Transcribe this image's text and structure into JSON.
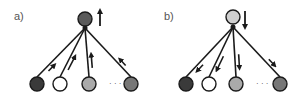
{
  "panels": [
    {
      "label": "a)",
      "direction": "up",
      "top_node": {
        "cx": 85,
        "cy": 19,
        "fill": "#5a5a5a"
      },
      "top_arrow": {
        "x": 100,
        "y1": 26,
        "y2": 11
      },
      "hub": {
        "x": 85,
        "y": 28
      },
      "bottom_nodes": [
        {
          "cx": 37,
          "cy": 84,
          "fill": "#3a3a3a"
        },
        {
          "cx": 60,
          "cy": 84,
          "fill": "#ffffff"
        },
        {
          "cx": 89,
          "cy": 84,
          "fill": "#aaaaaa"
        },
        {
          "cx": 131,
          "cy": 84,
          "fill": "#777777"
        }
      ],
      "ellipsis": {
        "x": 109,
        "y": 86,
        "text": "· · ·"
      }
    },
    {
      "label": "b)",
      "direction": "down",
      "top_node": {
        "cx": 233,
        "cy": 17,
        "fill": "#cfcfcf"
      },
      "top_arrow": {
        "x": 245,
        "y1": 11,
        "y2": 27
      },
      "hub": {
        "x": 233,
        "y": 27
      },
      "bottom_nodes": [
        {
          "cx": 186,
          "cy": 84,
          "fill": "#3a3a3a"
        },
        {
          "cx": 209,
          "cy": 84,
          "fill": "#ffffff"
        },
        {
          "cx": 236,
          "cy": 84,
          "fill": "#aaaaaa"
        },
        {
          "cx": 280,
          "cy": 84,
          "fill": "#777777"
        }
      ],
      "ellipsis": {
        "x": 256,
        "y": 86,
        "text": "· · ·"
      }
    }
  ],
  "style": {
    "edge_color": "#1a1a1a",
    "node_radius": 7
  }
}
